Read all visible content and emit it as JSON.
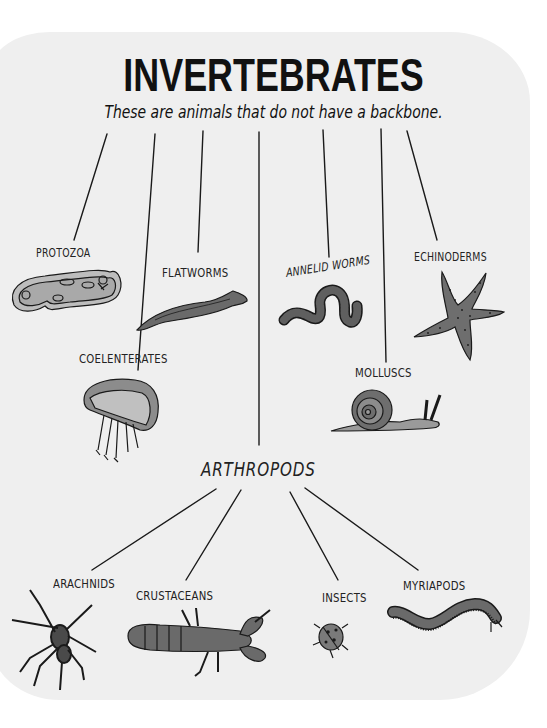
{
  "header": {
    "title": "INVERTEBRATES",
    "subtitle": "These are animals that do not have a backbone."
  },
  "groups": [
    {
      "id": "protozoa",
      "label": "PROTOZOA",
      "illustration": "paramecium"
    },
    {
      "id": "flatworms",
      "label": "FLATWORMS",
      "illustration": "flatworm"
    },
    {
      "id": "annelid-worms",
      "label": "ANNELID WORMS",
      "illustration": "earthworm"
    },
    {
      "id": "echinoderms",
      "label": "ECHINODERMS",
      "illustration": "starfish"
    },
    {
      "id": "coelenterates",
      "label": "COELENTERATES",
      "illustration": "jellyfish"
    },
    {
      "id": "molluscs",
      "label": "MOLLUSCS",
      "illustration": "snail"
    },
    {
      "id": "arthropods",
      "label": "ARTHROPODS",
      "illustration": "none"
    }
  ],
  "arthropods": {
    "label": "ARTHROPODS",
    "subgroups": [
      {
        "id": "arachnids",
        "label": "ARACHNIDS",
        "illustration": "spider"
      },
      {
        "id": "crustaceans",
        "label": "CRUSTACEANS",
        "illustration": "lobster"
      },
      {
        "id": "insects",
        "label": "INSECTS",
        "illustration": "ladybird"
      },
      {
        "id": "myriapods",
        "label": "MYRIAPODS",
        "illustration": "millipede"
      }
    ]
  },
  "colors": {
    "panel": "#efefef",
    "ink": "#1a1a1a",
    "fill_dark": "#5a5a5a",
    "fill_mid": "#8a8a8a",
    "fill_light": "#b8b8b8"
  }
}
